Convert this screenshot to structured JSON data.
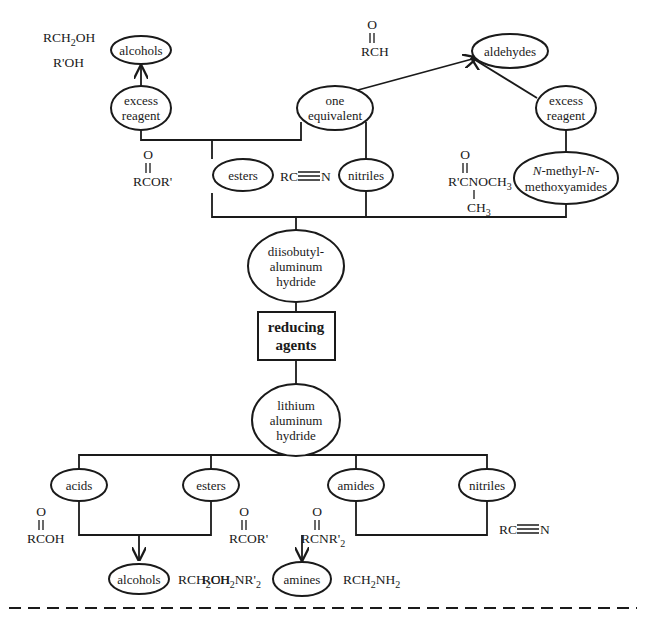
{
  "diagram": {
    "center_node": {
      "label_line1": "reducing",
      "label_line2": "agents"
    },
    "reagents": {
      "dibal": {
        "line1": "diisobutyl-",
        "line2": "aluminum",
        "line3": "hydride"
      },
      "lah": {
        "line1": "lithium",
        "line2": "aluminum",
        "line3": "hydride"
      }
    },
    "dibal_branch": {
      "conditions": {
        "excess_left": {
          "line1": "excess",
          "line2": "reagent"
        },
        "one_equivalent": {
          "line1": "one",
          "line2": "equivalent"
        },
        "excess_right": {
          "line1": "excess",
          "line2": "reagent"
        }
      },
      "substrates": {
        "esters": {
          "label": "esters",
          "formula_o": "O",
          "formula_main": "RCOR'"
        },
        "nitriles": {
          "label": "nitriles",
          "formula_left": "RC",
          "formula_right": "N"
        },
        "weinreb": {
          "label_italic1": "N",
          "label_part1": "-methyl-",
          "label_italic2": "N",
          "label_part2": "-",
          "label_line2": "methoxyamides",
          "formula_o": "O",
          "formula_main": "R'CNOCH",
          "formula_sub": "3",
          "formula_branch": "CH",
          "formula_branch_sub": "3"
        }
      },
      "products": {
        "alcohols": {
          "label": "alcohols",
          "formula1_main": "RCH",
          "formula1_sub": "2",
          "formula1_end": "OH",
          "formula2": "R'OH"
        },
        "aldehydes": {
          "label": "aldehydes",
          "formula_o": "O",
          "formula_main": "RCH"
        }
      }
    },
    "lah_branch": {
      "substrates": {
        "acids": {
          "label": "acids",
          "formula_o": "O",
          "formula_main": "RCOH"
        },
        "esters": {
          "label": "esters",
          "formula_o": "O",
          "formula_main": "RCOR'"
        },
        "amides": {
          "label": "amides",
          "formula_o": "O",
          "formula_main": "RCNR'",
          "formula_sub": "2"
        },
        "nitriles": {
          "label": "nitriles",
          "formula_left": "RC",
          "formula_right": "N"
        }
      },
      "products": {
        "alcohols": {
          "label": "alcohols",
          "formula_main": "RCH",
          "formula_sub": "2",
          "formula_end": "OH"
        },
        "amines": {
          "label": "amines",
          "left_main": "RCH",
          "left_sub": "2",
          "left_mid": "NR'",
          "left_sub2": "2",
          "right_main": "RCH",
          "right_sub": "2",
          "right_mid": "NH",
          "right_sub2": "2"
        }
      }
    }
  }
}
